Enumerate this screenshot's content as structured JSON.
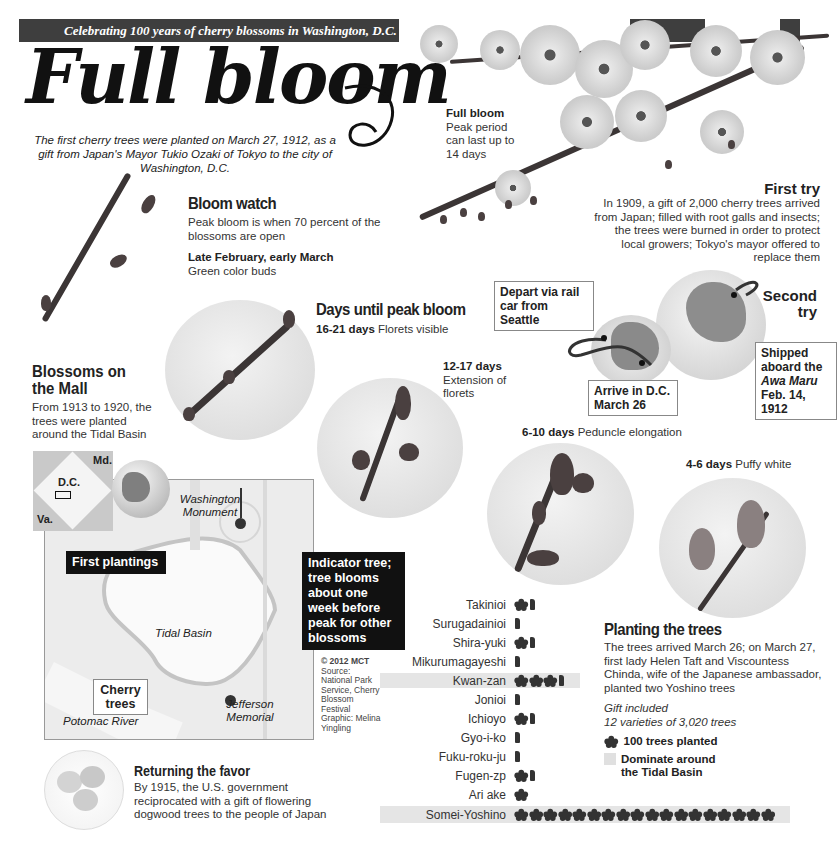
{
  "banner": {
    "text": "Celebrating 100 years of cherry blossoms in Washington, D.C."
  },
  "title": "Full bloom",
  "subtitle": "The first cherry trees were planted on March 27, 1912, as a gift from Japan's Mayor Tukio Ozaki of Tokyo to the city of Washington, D.C.",
  "full_bloom": {
    "heading": "Full bloom",
    "text": "Peak period can last up to 14 days"
  },
  "first_try": {
    "heading": "First try",
    "text": "In 1909, a gift of 2,000 cherry trees arrived from Japan; filled with root galls and insects; the trees were burned in order to protect local growers; Tokyo's mayor offered to replace them"
  },
  "bloom_watch": {
    "heading": "Bloom watch",
    "text": "Peak bloom is when 70 percent of the blossoms are open",
    "stage_label": "Late February, early March",
    "stage_desc": "Green color buds"
  },
  "days_until_peak": {
    "heading": "Days until peak bloom",
    "stages": [
      {
        "days": "16-21 days",
        "desc": "Florets visible"
      },
      {
        "days": "12-17 days",
        "desc": "Extension of florets"
      },
      {
        "days": "6-10 days",
        "desc": "Peduncle elongation"
      },
      {
        "days": "4-6 days",
        "desc": "Puffy white"
      }
    ]
  },
  "second_try": {
    "heading": "Second try",
    "depart": "Depart via rail car from Seattle",
    "arrive_line1": "Arrive in D.C.",
    "arrive_line2": "March 26",
    "shipped_line1": "Shipped aboard the",
    "shipped_ship": "Awa Maru",
    "shipped_date": "Feb. 14, 1912"
  },
  "blossoms_mall": {
    "heading": "Blossoms on the Mall",
    "text": "From 1913 to 1920, the trees were planted around the Tidal Basin"
  },
  "map": {
    "inset_labels": {
      "md": "Md.",
      "dc": "D.C.",
      "va": "Va."
    },
    "washington_monument": "Washington Monument",
    "first_plantings": "First plantings",
    "indicator_tree": "Indicator tree; tree blooms about one week before peak for other blossoms",
    "tidal_basin": "Tidal Basin",
    "cherry_trees": "Cherry trees",
    "potomac_river": "Potomac River",
    "jefferson_memorial": "Jefferson Memorial"
  },
  "credits": {
    "copyright": "© 2012 MCT",
    "source": "Source: National Park Service, Cherry Blossom Festival",
    "graphic": "Graphic: Melina Yingling"
  },
  "returning_favor": {
    "heading": "Returning the favor",
    "text": "By 1915, the U.S. government reciprocated with a gift of flowering dogwood trees to the people of Japan"
  },
  "planting": {
    "heading": "Planting the trees",
    "text": "The trees arrived March 26; on March 27, first lady Helen Taft and Viscountess Chinda, wife of the Japanese ambassador, planted two Yoshino trees",
    "gift_line1": "Gift included",
    "gift_line2": "12 varieties of 3,020 trees",
    "legend_icon": "100 trees planted",
    "legend_highlight": "Dominate around the Tidal Basin"
  },
  "chart_data": {
    "type": "bar",
    "xlabel": "",
    "ylabel": "Trees planted",
    "unit": "1 blossom icon = 100 trees",
    "categories": [
      "Takinioi",
      "Surugadainioi",
      "Shira-yuki",
      "Mikurumagayeshi",
      "Kwan-zan",
      "Jonioi",
      "Ichioyo",
      "Gyo-i-ko",
      "Fuku-roku-ju",
      "Fugen-zp",
      "Ari ake",
      "Somei-Yoshino"
    ],
    "values": [
      140,
      50,
      130,
      20,
      350,
      40,
      160,
      20,
      40,
      120,
      100,
      1800
    ],
    "highlighted": [
      "Kwan-zan",
      "Somei-Yoshino"
    ],
    "total_trees": 3020,
    "varieties": 12,
    "legend": [
      "100 trees planted",
      "Dominate around the Tidal Basin"
    ],
    "grid": false
  },
  "colors": {
    "banner": "#3e3e3e",
    "highlight": "#e5e5e5",
    "icon": "#333333",
    "callout_dark": "#111111"
  }
}
